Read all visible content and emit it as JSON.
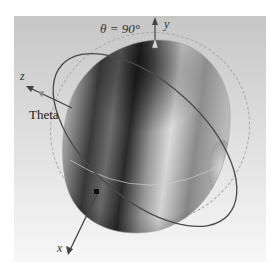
{
  "figure": {
    "background": {
      "top_color": "#c9c9c9",
      "bottom_color": "#f6f6f6"
    },
    "pattern": {
      "shape": "ellipsoid",
      "dark_color": "#1c1c1c",
      "mid_color": "#8a8a8a",
      "light_color": "#e2e2e2"
    },
    "labels": {
      "theta_plane": "θ = 90°",
      "theta": "Theta",
      "axis_x": "x",
      "axis_y": "y",
      "axis_z": "z"
    },
    "axes": [
      {
        "name": "x",
        "direction": "down-left"
      },
      {
        "name": "y",
        "direction": "up"
      },
      {
        "name": "z",
        "direction": "up-left"
      }
    ],
    "rings": [
      {
        "name": "theta-90-ring",
        "style": "dashed",
        "color": "#a8a8a8"
      },
      {
        "name": "tilted-ring",
        "style": "solid",
        "color": "#4a4a4a"
      }
    ]
  }
}
